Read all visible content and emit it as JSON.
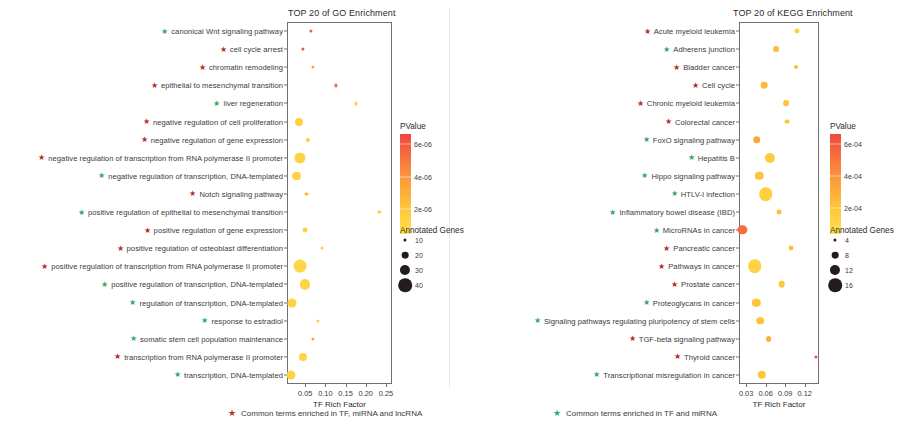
{
  "figure": {
    "caption_items": [
      {
        "marker": "star",
        "color": "#b03030",
        "text": "Common terms enriched in TF, miRNA and lncRNA"
      },
      {
        "marker": "star",
        "color": "#2fa86b",
        "text": "Common terms enriched in TF and miRNA"
      }
    ]
  },
  "chart_data": [
    {
      "type": "scatter",
      "id": "go",
      "title": "TOP 20 of GO Enrichment",
      "xlabel": "TF Rich Factor",
      "ylabel": "",
      "xlim": [
        0.005,
        0.265
      ],
      "xticks": [
        0.05,
        0.1,
        0.15,
        0.2,
        0.25
      ],
      "xticklabels": [
        "0.05",
        "0.10",
        "0.15",
        "0.20",
        "0.25"
      ],
      "grid": false,
      "size_legend": {
        "title": "Annotated Genes",
        "values": [
          10,
          20,
          30,
          40
        ]
      },
      "color_legend": {
        "title": "PValue",
        "ticks": [
          2e-06,
          4e-06,
          6e-06
        ],
        "ticklabels": [
          "2e-06",
          "4e-06",
          "6e-06"
        ],
        "vmin": 5e-07,
        "vmax": 6.6e-06,
        "low_color": "#ffe14f",
        "high_color": "#f4553f"
      },
      "points": [
        {
          "term": "canonical Wnt signaling pathway",
          "marker": "green",
          "x": 0.0635,
          "pvalue": 6e-06,
          "genes": 6
        },
        {
          "term": "cell cycle arrest",
          "marker": "red",
          "x": 0.0435,
          "pvalue": 6.1e-06,
          "genes": 9
        },
        {
          "term": "chromatin remodeling",
          "marker": "red",
          "x": 0.07,
          "pvalue": 3.3e-06,
          "genes": 8
        },
        {
          "term": "epithelial to mesenchymal transition",
          "marker": "red",
          "x": 0.126,
          "pvalue": 5.4e-06,
          "genes": 5
        },
        {
          "term": "liver regeneration",
          "marker": "green",
          "x": 0.176,
          "pvalue": 1.6e-06,
          "genes": 5
        },
        {
          "term": "negative regulation of cell proliferation",
          "marker": "red",
          "x": 0.0355,
          "pvalue": 1.6e-06,
          "genes": 24
        },
        {
          "term": "negative regulation of gene expression",
          "marker": "red",
          "x": 0.056,
          "pvalue": 1.9e-06,
          "genes": 13
        },
        {
          "term": "negative regulation of transcription from RNA polymerase II promoter",
          "marker": "red",
          "x": 0.037,
          "pvalue": 1.4e-06,
          "genes": 33
        },
        {
          "term": "negative regulation of transcription, DNA-templated",
          "marker": "green",
          "x": 0.0285,
          "pvalue": 1.5e-06,
          "genes": 24
        },
        {
          "term": "Notch signaling pathway",
          "marker": "red",
          "x": 0.053,
          "pvalue": 2.8e-06,
          "genes": 8
        },
        {
          "term": "positive regulation of epithelial to mesenchymal transition",
          "marker": "green",
          "x": 0.234,
          "pvalue": 1.5e-06,
          "genes": 5
        },
        {
          "term": "positive regulation of gene expression",
          "marker": "red",
          "x": 0.05,
          "pvalue": 1.5e-06,
          "genes": 15
        },
        {
          "term": "positive regulation of osteoblast differentiation",
          "marker": "red",
          "x": 0.091,
          "pvalue": 1.6e-06,
          "genes": 7
        },
        {
          "term": "positive regulation of transcription from RNA polymerase II promoter",
          "marker": "red",
          "x": 0.0375,
          "pvalue": 1.2e-06,
          "genes": 38
        },
        {
          "term": "positive regulation of transcription, DNA-templated",
          "marker": "green",
          "x": 0.05,
          "pvalue": 1.3e-06,
          "genes": 30
        },
        {
          "term": "regulation of transcription, DNA-templated",
          "marker": "green",
          "x": 0.018,
          "pvalue": 1.4e-06,
          "genes": 27
        },
        {
          "term": "response to estradiol",
          "marker": "green",
          "x": 0.082,
          "pvalue": 1.9e-06,
          "genes": 8
        },
        {
          "term": "somatic stem cell population maintenance",
          "marker": "green",
          "x": 0.07,
          "pvalue": 3.5e-06,
          "genes": 5
        },
        {
          "term": "transcription from RNA polymerase II promoter",
          "marker": "red",
          "x": 0.044,
          "pvalue": 1.3e-06,
          "genes": 24
        },
        {
          "term": "transcription, DNA-templated",
          "marker": "green",
          "x": 0.0155,
          "pvalue": 1.4e-06,
          "genes": 27
        }
      ]
    },
    {
      "type": "scatter",
      "id": "kegg",
      "title": "TOP 20 of KEGG Enrichment",
      "xlabel": "TF Rich Factor",
      "ylabel": "",
      "xlim": [
        0.019,
        0.142
      ],
      "xticks": [
        0.03,
        0.06,
        0.09,
        0.12
      ],
      "xticklabels": [
        "0.03",
        "0.06",
        "0.09",
        "0.12"
      ],
      "grid": false,
      "size_legend": {
        "title": "Annotated Genes",
        "values": [
          4,
          8,
          12,
          16
        ]
      },
      "color_legend": {
        "title": "PValue",
        "ticks": [
          0.0002,
          0.0004,
          0.0006
        ],
        "ticklabels": [
          "2e-04",
          "4e-04",
          "6e-04"
        ],
        "vmin": 4e-05,
        "vmax": 0.00066,
        "low_color": "#ffe14f",
        "high_color": "#f4553f"
      },
      "points": [
        {
          "term": "Acute myeloid leukemia",
          "marker": "red",
          "x": 0.1085,
          "pvalue": 0.00015,
          "genes": 6
        },
        {
          "term": "Adherens junction",
          "marker": "green",
          "x": 0.0755,
          "pvalue": 0.00024,
          "genes": 7
        },
        {
          "term": "Bladder cancer",
          "marker": "red",
          "x": 0.1065,
          "pvalue": 0.00026,
          "genes": 5
        },
        {
          "term": "Cell cycle",
          "marker": "red",
          "x": 0.058,
          "pvalue": 0.00026,
          "genes": 8
        },
        {
          "term": "Chronic myeloid leukemia",
          "marker": "red",
          "x": 0.0915,
          "pvalue": 0.00021,
          "genes": 7
        },
        {
          "term": "Colorectal cancer",
          "marker": "red",
          "x": 0.093,
          "pvalue": 0.00021,
          "genes": 6
        },
        {
          "term": "FoxO signaling pathway",
          "marker": "green",
          "x": 0.046,
          "pvalue": 0.00033,
          "genes": 9
        },
        {
          "term": "Hepatitis B",
          "marker": "green",
          "x": 0.066,
          "pvalue": 0.00018,
          "genes": 12
        },
        {
          "term": "Hippo signaling pathway",
          "marker": "green",
          "x": 0.0505,
          "pvalue": 0.00021,
          "genes": 10
        },
        {
          "term": "HTLV-I infection",
          "marker": "green",
          "x": 0.06,
          "pvalue": 0.00015,
          "genes": 16
        },
        {
          "term": "Inflammatory bowel disease (IBD)",
          "marker": "green",
          "x": 0.08,
          "pvalue": 0.00023,
          "genes": 6
        },
        {
          "term": "MicroRNAs in cancer",
          "marker": "green",
          "x": 0.024,
          "pvalue": 0.00053,
          "genes": 11
        },
        {
          "term": "Pancreatic cancer",
          "marker": "red",
          "x": 0.0995,
          "pvalue": 0.00022,
          "genes": 6
        },
        {
          "term": "Pathways in cancer",
          "marker": "red",
          "x": 0.043,
          "pvalue": 0.00013,
          "genes": 16
        },
        {
          "term": "Prostate cancer",
          "marker": "red",
          "x": 0.0845,
          "pvalue": 0.0002,
          "genes": 8
        },
        {
          "term": "Proteoglycans in cancer",
          "marker": "green",
          "x": 0.0455,
          "pvalue": 0.00021,
          "genes": 10
        },
        {
          "term": "Signaling pathways regulating pluripotency of stem cells",
          "marker": "green",
          "x": 0.052,
          "pvalue": 0.00022,
          "genes": 9
        },
        {
          "term": "TGF-beta signaling pathway",
          "marker": "red",
          "x": 0.0645,
          "pvalue": 0.0003,
          "genes": 7
        },
        {
          "term": "Thyroid cancer",
          "marker": "red",
          "x": 0.137,
          "pvalue": 0.00064,
          "genes": 3
        },
        {
          "term": "Transcriptional misregulation in cancer",
          "marker": "green",
          "x": 0.0545,
          "pvalue": 0.0002,
          "genes": 10
        }
      ]
    }
  ]
}
